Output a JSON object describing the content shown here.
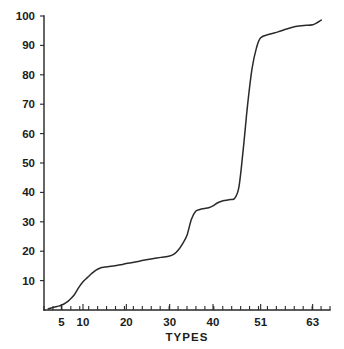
{
  "chart_data": {
    "type": "line",
    "title": "",
    "subtitle": "",
    "xlabel": "TYPES",
    "ylabel": "",
    "grid": false,
    "legend": false,
    "legend_position": "none",
    "line_color": "#2a2a2a",
    "background_color": "#ffffff",
    "axis_color": "#262626",
    "xlim": [
      1,
      67
    ],
    "ylim": [
      0,
      100
    ],
    "y_ticks": [
      10,
      20,
      30,
      40,
      50,
      60,
      70,
      80,
      90,
      100
    ],
    "y_tick_labels": [
      "10",
      "20",
      "30",
      "40",
      "50",
      "60",
      "70",
      "80",
      "90",
      "100"
    ],
    "x_ticks": [
      5,
      10,
      20,
      30,
      40,
      51,
      63
    ],
    "x_tick_labels": [
      "5",
      "10",
      "20",
      "30",
      "40",
      "51",
      "63"
    ],
    "x_minor_tick_count": 32,
    "x": [
      2,
      3,
      4,
      5,
      6,
      7,
      8,
      9,
      10,
      11,
      12,
      13,
      14,
      15,
      16,
      17,
      18,
      19,
      20,
      22,
      24,
      26,
      28,
      30,
      31,
      32,
      33,
      34,
      35,
      36,
      37,
      38,
      39,
      40,
      41,
      42,
      43,
      44,
      45,
      46,
      47,
      48,
      49,
      50,
      51,
      53,
      55,
      57,
      59,
      61,
      63,
      65
    ],
    "y": [
      0.4,
      0.8,
      1.2,
      1.6,
      2.4,
      3.6,
      5.2,
      7.6,
      9.6,
      11.0,
      12.4,
      13.6,
      14.3,
      14.6,
      14.8,
      15.0,
      15.2,
      15.5,
      15.8,
      16.3,
      16.9,
      17.4,
      17.9,
      18.4,
      19.0,
      20.4,
      22.6,
      25.4,
      30.8,
      33.6,
      34.2,
      34.5,
      34.8,
      35.4,
      36.4,
      37.0,
      37.3,
      37.6,
      38.0,
      42.0,
      55.0,
      70.0,
      82.0,
      89.0,
      92.6,
      93.8,
      94.6,
      95.6,
      96.4,
      96.8,
      97.0,
      98.6
    ],
    "series": [
      {
        "name": "cumulative",
        "values": [
          0.4,
          0.8,
          1.2,
          1.6,
          2.4,
          3.6,
          5.2,
          7.6,
          9.6,
          11.0,
          12.4,
          13.6,
          14.3,
          14.6,
          14.8,
          15.0,
          15.2,
          15.5,
          15.8,
          16.3,
          16.9,
          17.4,
          17.9,
          18.4,
          19.0,
          20.4,
          22.6,
          25.4,
          30.8,
          33.6,
          34.2,
          34.5,
          34.8,
          35.4,
          36.4,
          37.0,
          37.3,
          37.6,
          38.0,
          42.0,
          55.0,
          70.0,
          82.0,
          89.0,
          92.6,
          93.8,
          94.6,
          95.6,
          96.4,
          96.8,
          97.0,
          98.6
        ]
      }
    ],
    "annotations": []
  }
}
